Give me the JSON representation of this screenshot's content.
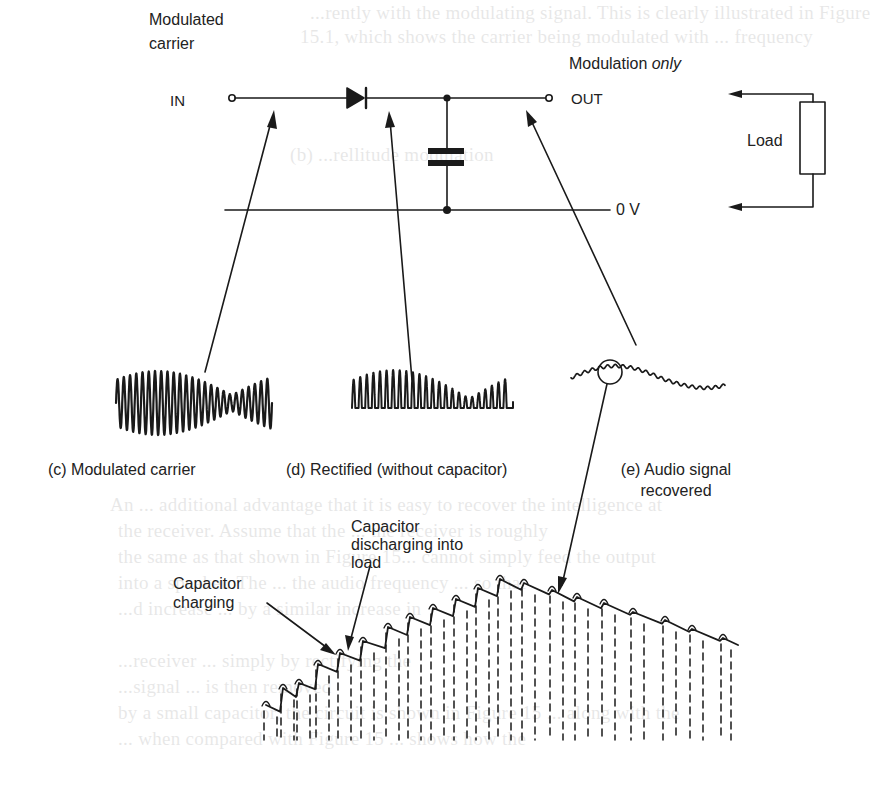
{
  "figure": {
    "labels": {
      "input_line1": "Modulated",
      "input_line2": "carrier",
      "input_terminal": "IN",
      "output_heading_main": "Modulation ",
      "output_heading_em": "only",
      "output_terminal": "OUT",
      "ground": "0 V",
      "load": "Load"
    },
    "captions": {
      "c": "(c) Modulated carrier",
      "d": "(d) Rectified (without capacitor)",
      "e_line1": "(e) Audio signal",
      "e_line2": "recovered"
    },
    "annotations": {
      "discharge_line1": "Capacitor",
      "discharge_line2": "discharging into",
      "discharge_line3": "load",
      "charge_line1": "Capacitor",
      "charge_line2": "charging"
    },
    "components": [
      "diode",
      "capacitor",
      "load-resistor"
    ],
    "colors": {
      "ink": "#1a1a1a",
      "paper": "#ffffff"
    }
  },
  "bleed_through_text": [
    "...rently with the modulating signal. This is clearly illustrated in Figure",
    "15.1, which shows the carrier being modulated with ... frequency",
    "(b) ...rellitude modulation",
    "An ... additional advantage that it is easy to recover the intelligence at",
    "the receiver. Assume that the ... the receiver is roughly",
    "the same as that shown in Figure 15... cannot simply feed the output",
    "into a speaker. The ... the audio frequency ... so that",
    "...d increase ... by a similar increase in",
    "...receiver ... simply by rectifying the",
    "...signal ... is then removed",
    "by a small capacitor, the circuit is shown in Figure 15 ... along with the",
    "... when compared with Figure 15 ... shows how the"
  ]
}
